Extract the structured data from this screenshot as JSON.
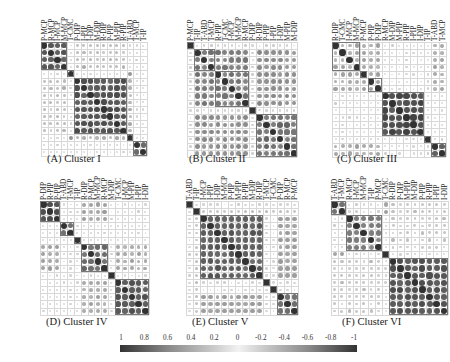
{
  "figure": {
    "colorbar": {
      "ticks": [
        "1",
        "0.8",
        "0.6",
        "0.4",
        "0.2",
        "0",
        "-0.2",
        "-0.4",
        "-0.6",
        "-0.8",
        "-1"
      ],
      "min": -1,
      "max": 1,
      "colors": {
        "high": "#333333",
        "mid": "#f2f2f2",
        "low": "#333333"
      }
    }
  },
  "chart_data": [
    {
      "type": "heatmap",
      "title": "(A) Cluster I",
      "labels": [
        "P-MCP",
        "R-MCP",
        "I-MCP",
        "M-MCP",
        "T-CMC",
        "P-DIP",
        "I-PIP",
        "I-DIP",
        "M-DIP",
        "R-DIP",
        "P-PIP",
        "M-PIP",
        "R-PIP",
        "T-ABD",
        "T-MCP",
        "T-IP"
      ],
      "boxes": [
        [
          0,
          3
        ],
        [
          4,
          4
        ],
        [
          5,
          12
        ],
        [
          13,
          13
        ],
        [
          14,
          15
        ]
      ],
      "blocks": [
        {
          "rows": [
            0,
            3
          ],
          "cols": [
            0,
            3
          ],
          "v": 0.75
        },
        {
          "rows": [
            5,
            12
          ],
          "cols": [
            5,
            12
          ],
          "v": 0.8
        },
        {
          "rows": [
            14,
            15
          ],
          "cols": [
            14,
            15
          ],
          "v": 0.75
        },
        {
          "rows": [
            4,
            4
          ],
          "cols": [
            13,
            13
          ],
          "v": 0.8
        },
        {
          "rows": [
            0,
            3
          ],
          "cols": [
            5,
            12
          ],
          "v": 0.25
        },
        {
          "rows": [
            5,
            12
          ],
          "cols": [
            0,
            3
          ],
          "v": 0.25
        },
        {
          "rows": [
            5,
            12
          ],
          "cols": [
            13,
            13
          ],
          "v": 0.3
        },
        {
          "rows": [
            13,
            13
          ],
          "cols": [
            5,
            12
          ],
          "v": 0.3
        },
        {
          "rows": [
            14,
            15
          ],
          "cols": [
            5,
            12
          ],
          "v": 0.12
        }
      ]
    },
    {
      "type": "heatmap",
      "title": "(B) Cluster II",
      "labels": [
        "P-MCP",
        "T-IP",
        "T-ABD",
        "T-MCP",
        "R-PIP",
        "T-CMC",
        "I-MCP",
        "M-MCP",
        "R-MCP",
        "P-DIP",
        "R-DIP",
        "P-PIP",
        "I-PIP",
        "I-DIP",
        "M-PIP",
        "M-DIP"
      ],
      "boxes": [
        [
          0,
          0
        ],
        [
          1,
          3
        ],
        [
          4,
          8
        ],
        [
          9,
          9
        ],
        [
          10,
          15
        ]
      ],
      "blocks": [
        {
          "rows": [
            1,
            8
          ],
          "cols": [
            1,
            8
          ],
          "v": 0.6
        },
        {
          "rows": [
            10,
            15
          ],
          "cols": [
            10,
            15
          ],
          "v": 0.65
        },
        {
          "rows": [
            1,
            8
          ],
          "cols": [
            10,
            15
          ],
          "v": 0.5
        },
        {
          "rows": [
            10,
            15
          ],
          "cols": [
            1,
            8
          ],
          "v": 0.5
        },
        {
          "rows": [
            9,
            9
          ],
          "cols": [
            0,
            15
          ],
          "v": 0.15
        },
        {
          "rows": [
            0,
            0
          ],
          "cols": [
            1,
            15
          ],
          "v": 0.15
        }
      ]
    },
    {
      "type": "heatmap",
      "title": "(C) Cluster III",
      "labels": [
        "R-DIP",
        "T-CMC",
        "I-MCP",
        "M-MCP",
        "P-MCP",
        "P-PIP",
        "P-DIP",
        "R-MCP",
        "M-DIP",
        "M-PIP",
        "R-PIP",
        "I-PIP",
        "I-DIP",
        "T-IP",
        "T-ABD",
        "T-MCP"
      ],
      "boxes": [
        [
          0,
          3
        ],
        [
          4,
          4
        ],
        [
          5,
          6
        ],
        [
          7,
          12
        ],
        [
          13,
          13
        ],
        [
          14,
          15
        ]
      ],
      "blocks": [
        {
          "rows": [
            0,
            3
          ],
          "cols": [
            0,
            3
          ],
          "v": 0.7
        },
        {
          "rows": [
            4,
            6
          ],
          "cols": [
            4,
            6
          ],
          "v": 0.55
        },
        {
          "rows": [
            7,
            12
          ],
          "cols": [
            7,
            12
          ],
          "v": 0.85
        },
        {
          "rows": [
            14,
            15
          ],
          "cols": [
            14,
            15
          ],
          "v": 0.7
        },
        {
          "rows": [
            0,
            6
          ],
          "cols": [
            0,
            6
          ],
          "v": 0.35
        },
        {
          "rows": [
            14,
            15
          ],
          "cols": [
            0,
            6
          ],
          "v": 0.35
        },
        {
          "rows": [
            0,
            6
          ],
          "cols": [
            14,
            15
          ],
          "v": 0.35
        },
        {
          "rows": [
            7,
            12
          ],
          "cols": [
            0,
            6
          ],
          "v": 0.08
        }
      ]
    },
    {
      "type": "heatmap",
      "title": "(D) Cluster IV",
      "labels": [
        "P-DIP",
        "R-PIP",
        "P-PIP",
        "T-ABD",
        "T-MCP",
        "T-IP",
        "R-DIP",
        "P-MCP",
        "M-MCP",
        "R-MCP",
        "M-DIP",
        "T-CMC",
        "I-MCP",
        "M-PIP",
        "I-PIP",
        "I-DIP"
      ],
      "boxes": [
        [
          0,
          2
        ],
        [
          3,
          4
        ],
        [
          5,
          5
        ],
        [
          6,
          9
        ],
        [
          10,
          10
        ],
        [
          11,
          15
        ]
      ],
      "blocks": [
        {
          "rows": [
            0,
            2
          ],
          "cols": [
            0,
            2
          ],
          "v": 0.8
        },
        {
          "rows": [
            3,
            4
          ],
          "cols": [
            3,
            4
          ],
          "v": 0.7
        },
        {
          "rows": [
            6,
            9
          ],
          "cols": [
            6,
            9
          ],
          "v": 0.7
        },
        {
          "rows": [
            11,
            15
          ],
          "cols": [
            11,
            15
          ],
          "v": 0.8
        },
        {
          "rows": [
            6,
            9
          ],
          "cols": [
            0,
            2
          ],
          "v": 0.4
        },
        {
          "rows": [
            0,
            2
          ],
          "cols": [
            6,
            9
          ],
          "v": 0.4
        },
        {
          "rows": [
            11,
            15
          ],
          "cols": [
            6,
            9
          ],
          "v": 0.35
        },
        {
          "rows": [
            6,
            9
          ],
          "cols": [
            11,
            15
          ],
          "v": 0.35
        }
      ]
    },
    {
      "type": "heatmap",
      "title": "(E) Cluster V",
      "labels": [
        "T-ABD",
        "T-IP",
        "I-MCP",
        "I-PIP",
        "I-DIP",
        "M-MCP",
        "P-PIP",
        "M-PIP",
        "R-PIP",
        "M-DIP",
        "R-DIP",
        "T-MCP",
        "T-CMC",
        "P-DIP",
        "R-MCP",
        "P-MCP"
      ],
      "boxes": [
        [
          0,
          0
        ],
        [
          1,
          1
        ],
        [
          2,
          10
        ],
        [
          11,
          11
        ],
        [
          12,
          12
        ],
        [
          13,
          15
        ]
      ],
      "blocks": [
        {
          "rows": [
            2,
            10
          ],
          "cols": [
            2,
            10
          ],
          "v": 0.75
        },
        {
          "rows": [
            13,
            15
          ],
          "cols": [
            13,
            15
          ],
          "v": 0.65
        },
        {
          "rows": [
            13,
            15
          ],
          "cols": [
            2,
            10
          ],
          "v": 0.4
        },
        {
          "rows": [
            2,
            10
          ],
          "cols": [
            13,
            15
          ],
          "v": 0.4
        },
        {
          "rows": [
            1,
            1
          ],
          "cols": [
            2,
            15
          ],
          "v": 0.3
        }
      ]
    },
    {
      "type": "heatmap",
      "title": "(F) Cluster VI",
      "labels": [
        "T-ABD",
        "T-MCP",
        "R-MCP",
        "I-MCP",
        "M-MCP",
        "T-IP",
        "P-MCP",
        "T-CMC",
        "R-DIP",
        "P-DIP",
        "M-PIP",
        "M-DIP",
        "P-PIP",
        "R-PIP",
        "I-PIP",
        "I-DIP"
      ],
      "boxes": [
        [
          0,
          1
        ],
        [
          2,
          6
        ],
        [
          7,
          7
        ],
        [
          8,
          15
        ]
      ],
      "blocks": [
        {
          "rows": [
            0,
            1
          ],
          "cols": [
            0,
            1
          ],
          "v": 0.7
        },
        {
          "rows": [
            2,
            6
          ],
          "cols": [
            2,
            6
          ],
          "v": 0.6
        },
        {
          "rows": [
            8,
            15
          ],
          "cols": [
            8,
            15
          ],
          "v": 0.8
        },
        {
          "rows": [
            8,
            15
          ],
          "cols": [
            0,
            6
          ],
          "v": 0.2
        },
        {
          "rows": [
            0,
            6
          ],
          "cols": [
            8,
            15
          ],
          "v": 0.2
        },
        {
          "rows": [
            7,
            7
          ],
          "cols": [
            0,
            1
          ],
          "v": 0.7
        }
      ]
    }
  ],
  "layout": {
    "panels": [
      {
        "x": 41,
        "y": 42,
        "cw": 6.6,
        "rh": 7.1,
        "captionX": 47,
        "captionY": 153
      },
      {
        "x": 187,
        "y": 42,
        "cw": 6.9,
        "rh": 7.2,
        "captionX": 189,
        "captionY": 153
      },
      {
        "x": 332,
        "y": 42,
        "cw": 7.1,
        "rh": 7.2,
        "captionX": 337,
        "captionY": 153
      },
      {
        "x": 40,
        "y": 201,
        "cw": 6.8,
        "rh": 7.1,
        "captionX": 46,
        "captionY": 316
      },
      {
        "x": 186,
        "y": 201,
        "cw": 7.0,
        "rh": 7.1,
        "captionX": 192,
        "captionY": 316
      },
      {
        "x": 331,
        "y": 201,
        "cw": 7.3,
        "rh": 7.1,
        "captionX": 342,
        "captionY": 316
      }
    ]
  }
}
